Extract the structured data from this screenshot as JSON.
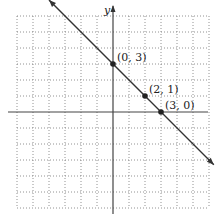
{
  "chart_data": {
    "type": "line",
    "title": "",
    "xlabel": "",
    "ylabel": "y",
    "xlim": [
      -6,
      6
    ],
    "ylim": [
      -6,
      6
    ],
    "grid": true,
    "series": [
      {
        "name": "line",
        "equation": "y = -x + 3",
        "x": [
          -3,
          6
        ],
        "y": [
          6,
          -3
        ]
      }
    ],
    "points": [
      {
        "x": 0,
        "y": 3,
        "label": "(0, 3)"
      },
      {
        "x": 2,
        "y": 1,
        "label": "(2, 1)"
      },
      {
        "x": 3,
        "y": 0,
        "label": "(3, 0)"
      }
    ]
  }
}
